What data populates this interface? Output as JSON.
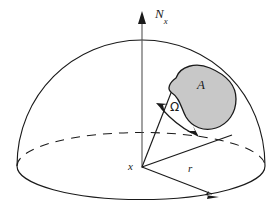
{
  "figure": {
    "background_color": "#ffffff",
    "line_color": "#1a1a1a",
    "patch_fill_color": "#c8c8c8",
    "patch_stroke_color": "#1a1a1a"
  },
  "labels": {
    "axis_normal": "N",
    "axis_normal_sub": "x",
    "patch_area": "A",
    "solid_angle": "Ω",
    "origin_point": "x",
    "radius": "r"
  },
  "icons": {
    "axis_arrow": "arrow-up-icon",
    "radius_arrow": "arrow-right-icon",
    "angle_arc_arrow": "double-arrow-arc-icon"
  },
  "geometry": {
    "origin": [
      142,
      167
    ],
    "dome_apex": [
      142,
      38
    ],
    "dome_left": [
      17,
      166
    ],
    "dome_right": [
      262,
      166
    ],
    "base_ellipse_rx": 122,
    "base_ellipse_ry": 33,
    "radius_arrow_tip": [
      216,
      197
    ],
    "axis_top": [
      142,
      13
    ]
  }
}
